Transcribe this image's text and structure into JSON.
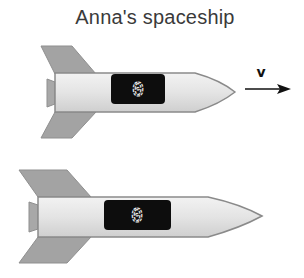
{
  "title": "Anna's spaceship",
  "velocity_label": "v",
  "rockets": [
    {
      "name": "anna-spaceship",
      "clock_reading": "0",
      "moving": true
    },
    {
      "name": "stationary-spaceship",
      "clock_reading": "0",
      "moving": false
    }
  ],
  "colors": {
    "fin": "#a3a3a3",
    "body": "#e6e6e6",
    "body_outline": "#8a8a8a",
    "display": "#0d0d0d",
    "digit": "#e8e8e8",
    "arrow": "#111111",
    "title": "#3a3a3a"
  }
}
